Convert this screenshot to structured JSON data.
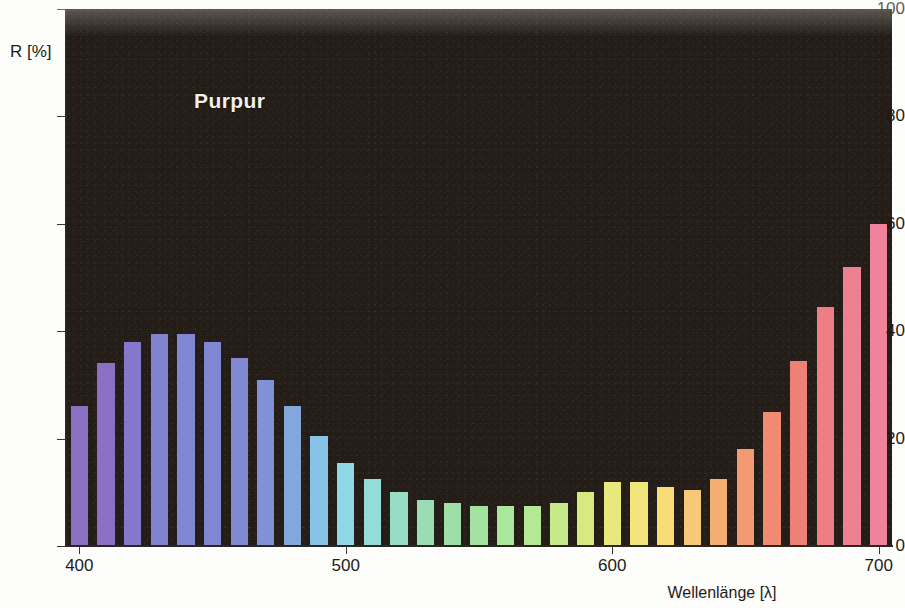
{
  "chart_data": {
    "type": "bar",
    "title": "Purpur",
    "xlabel": "Wellenlänge [λ]",
    "ylabel": "R [%]",
    "xlim": [
      395,
      705
    ],
    "ylim": [
      0,
      100
    ],
    "grid": false,
    "legend": "none",
    "x_ticks": [
      400,
      500,
      600,
      700
    ],
    "y_ticks": [
      0,
      20,
      40,
      60,
      80,
      100
    ],
    "x_tick_labels": [
      "400",
      "500",
      "600",
      "700"
    ],
    "y_tick_labels": [
      "0",
      "20",
      "40",
      "60",
      "80",
      "100"
    ],
    "bar_unit": "nm",
    "bar_width_nm": 6.5,
    "categories": [
      400,
      410,
      420,
      430,
      440,
      450,
      460,
      470,
      480,
      490,
      500,
      510,
      520,
      530,
      540,
      550,
      560,
      570,
      580,
      590,
      600,
      610,
      620,
      630,
      640,
      650,
      660,
      670,
      680,
      690,
      700
    ],
    "values": [
      26,
      34,
      38,
      39.5,
      39.5,
      38,
      35,
      31,
      26,
      20.5,
      15.5,
      12.5,
      10,
      8.5,
      8,
      7.5,
      7.5,
      7.5,
      8,
      10,
      12,
      12,
      11,
      10.5,
      12.5,
      18,
      25,
      34.5,
      44.5,
      52,
      60
    ],
    "bar_colors": [
      "#8b6fc2",
      "#8b6fc2",
      "#8577cc",
      "#8283d0",
      "#8186d2",
      "#8186d2",
      "#8189d3",
      "#8191d6",
      "#83a7dd",
      "#86c3e6",
      "#8fd6e6",
      "#95dcd9",
      "#97dcc4",
      "#9adcb4",
      "#9edfa8",
      "#a3e2a0",
      "#aae79c",
      "#b4e894",
      "#c6e98a",
      "#d8e982",
      "#e8e87c",
      "#f2e57a",
      "#f6dd78",
      "#f6c878",
      "#f4ae74",
      "#f29a72",
      "#f08a72",
      "#ef8078",
      "#ee7e84",
      "#ef8091",
      "#f0829c"
    ],
    "notes": {
      "peak_wavelength_nm": 430,
      "peak_value": 39.5,
      "minimum_wavelength_nm": 550,
      "minimum_value": 7.5,
      "max_value": 60,
      "max_wavelength_nm": 700
    }
  },
  "layout": {
    "plot_left_px": 66,
    "plot_top_px": 9,
    "plot_width_px": 826,
    "plot_height_px": 537,
    "background_color": "#231c17",
    "title_color": "#f2f0ec",
    "axis_text_color": "#1d1b19"
  }
}
